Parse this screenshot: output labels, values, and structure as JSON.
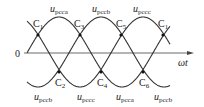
{
  "diagram": {
    "type": "three-phase sinusoidal waveforms with crossing points",
    "axis": {
      "origin_label": "0",
      "x_label": "ωt"
    },
    "waves": [
      {
        "id": "a",
        "label_main": "u",
        "label_sub": "pcca",
        "phase_deg": 0
      },
      {
        "id": "b",
        "label_main": "u",
        "label_sub": "pccb",
        "phase_deg": -120
      },
      {
        "id": "c",
        "label_main": "u",
        "label_sub": "pccc",
        "phase_deg": -240
      }
    ],
    "top_labels": [
      {
        "main": "u",
        "sub": "pcca",
        "x": 50,
        "y": 12
      },
      {
        "main": "u",
        "sub": "pccb",
        "x": 92,
        "y": 12
      },
      {
        "main": "u",
        "sub": "pccc",
        "x": 133,
        "y": 12
      }
    ],
    "bottom_labels": [
      {
        "main": "u",
        "sub": "pccb",
        "x": 34,
        "y": 100
      },
      {
        "main": "u",
        "sub": "pccc",
        "x": 77,
        "y": 100
      },
      {
        "main": "u",
        "sub": "pcca",
        "x": 116,
        "y": 100
      },
      {
        "main": "u",
        "sub": "pccb",
        "x": 154,
        "y": 100
      }
    ],
    "crossing_points": [
      {
        "label": "C",
        "sub": "1",
        "x": 38,
        "y": 35,
        "label_x": 33,
        "label_y": 27
      },
      {
        "label": "C",
        "sub": "3",
        "x": 80,
        "y": 35,
        "label_x": 74,
        "label_y": 27
      },
      {
        "label": "C",
        "sub": "5",
        "x": 121,
        "y": 35,
        "label_x": 116,
        "label_y": 27
      },
      {
        "label": "C",
        "sub": "1",
        "x": 163,
        "y": 35,
        "label_x": 158,
        "label_y": 27
      },
      {
        "label": "C",
        "sub": "2",
        "x": 59,
        "y": 72,
        "label_x": 55,
        "label_y": 86
      },
      {
        "label": "C",
        "sub": "4",
        "x": 101,
        "y": 72,
        "label_x": 97,
        "label_y": 86
      },
      {
        "label": "C",
        "sub": "6",
        "x": 143,
        "y": 72,
        "label_x": 139,
        "label_y": 86
      }
    ]
  }
}
